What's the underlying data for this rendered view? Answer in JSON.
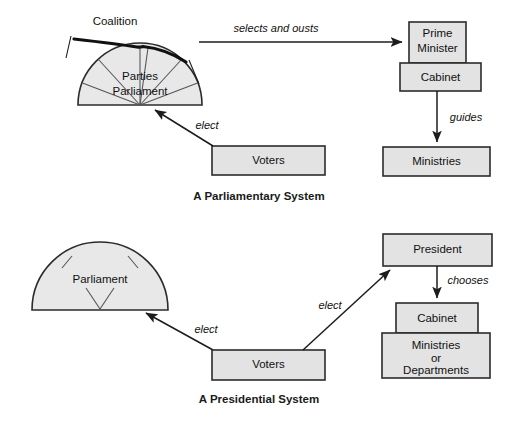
{
  "figure": {
    "title_top": "A Parliamentary System",
    "title_bottom": "A Presidential System",
    "colors": {
      "box_fill": "#e3e3e3",
      "shape_fill": "#e8e8e8",
      "stroke": "#2b2b2b",
      "background": "#ffffff"
    }
  },
  "parliamentary": {
    "caption": "A Parliamentary System",
    "coalition_label": "Coalition",
    "parliament_line1": "Parties",
    "parliament_line2": "Parliament",
    "boxes": {
      "prime_minister_line1": "Prime",
      "prime_minister_line2": "Minister",
      "cabinet": "Cabinet",
      "ministries": "Ministries",
      "voters": "Voters"
    },
    "edges": {
      "selects_and_ousts": "selects and ousts",
      "elect": "elect",
      "guides": "guides"
    }
  },
  "presidential": {
    "caption": "A Presidential System",
    "parliament_label": "Parliament",
    "boxes": {
      "president": "President",
      "cabinet": "Cabinet",
      "ministries_line1": "Ministries",
      "ministries_line2": "or",
      "ministries_line3": "Departments",
      "voters": "Voters"
    },
    "edges": {
      "elect_parliament": "elect",
      "elect_president": "elect",
      "chooses": "chooses"
    }
  }
}
